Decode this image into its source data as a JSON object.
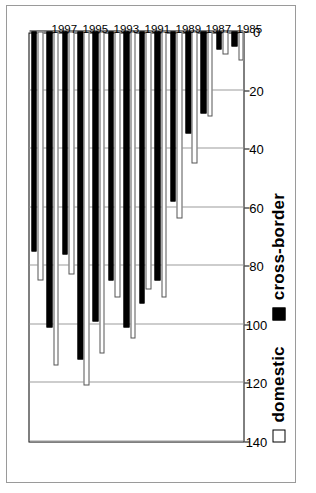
{
  "chart_data": {
    "type": "bar",
    "orientation": "horizontal",
    "title": "",
    "xlabel": "",
    "ylabel": "",
    "ylim": [
      0,
      140
    ],
    "value_ticks": [
      140,
      120,
      100,
      80,
      60,
      40,
      20,
      0
    ],
    "value_axis_reversed": true,
    "grid": true,
    "legend_position": "bottom-right",
    "categories": [
      "1998",
      "1997",
      "1996",
      "1995",
      "1994",
      "1993",
      "1992",
      "1991",
      "1990",
      "1989",
      "1988",
      "1987",
      "1986",
      "1985"
    ],
    "axis_tick_labels": [
      "1997",
      "1995",
      "1993",
      "1991",
      "1989",
      "1987",
      "1985"
    ],
    "series": [
      {
        "name": "domestic",
        "color": "#ffffff",
        "values": [
          85,
          114,
          83,
          121,
          110,
          91,
          105,
          88,
          91,
          64,
          45,
          29,
          8,
          10
        ]
      },
      {
        "name": "cross-border",
        "color": "#000000",
        "values": [
          75,
          101,
          76,
          112,
          99,
          85,
          101,
          93,
          85,
          58,
          35,
          28,
          6,
          5
        ]
      }
    ]
  },
  "legend": {
    "items": [
      {
        "label": "domestic",
        "swatch": "hollow-square-icon"
      },
      {
        "label": "cross-border",
        "swatch": "filled-square-icon"
      }
    ]
  },
  "caption": {
    "text": ""
  }
}
